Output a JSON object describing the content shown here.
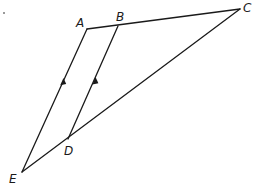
{
  "diagram": {
    "type": "geometry",
    "points": {
      "A": {
        "label": "A",
        "x": 87,
        "y": 29
      },
      "B": {
        "label": "B",
        "x": 118,
        "y": 26
      },
      "C": {
        "label": "C",
        "x": 240,
        "y": 9
      },
      "D": {
        "label": "D",
        "x": 68,
        "y": 139
      },
      "E": {
        "label": "E",
        "x": 22,
        "y": 172
      }
    },
    "segments": [
      {
        "from": "A",
        "to": "C",
        "name": "AC"
      },
      {
        "from": "A",
        "to": "E",
        "name": "AE",
        "parallel_marker": true
      },
      {
        "from": "B",
        "to": "D",
        "name": "BD",
        "parallel_marker": true
      },
      {
        "from": "C",
        "to": "E",
        "name": "CE"
      }
    ],
    "relations": [
      "AE ∥ BD"
    ],
    "stroke_color": "#1a1a1a",
    "background": "#ffffff"
  }
}
